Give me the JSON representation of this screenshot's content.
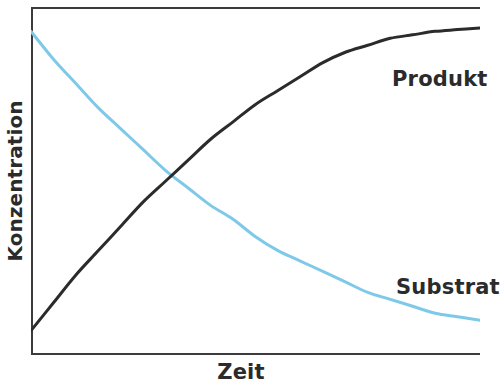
{
  "figure": {
    "background_color": "#ffffff",
    "frame_color": "#3b3b3b"
  },
  "axes": {
    "x_label": "Zeit",
    "y_label": "Konzentration"
  },
  "annotations": {
    "produkt_label": "Produkt",
    "substrat_label": "Substrat"
  },
  "chart_data": {
    "type": "line",
    "title": "",
    "subtitle": "",
    "xlabel": "Zeit",
    "ylabel": "Konzentration",
    "xlim": [
      0,
      1
    ],
    "ylim": [
      0,
      1
    ],
    "grid": false,
    "legend": "inline annotations at curve ends",
    "axis_ticks": {
      "x": [],
      "y": []
    },
    "series": [
      {
        "name": "Produkt",
        "color": "#2b2b2b",
        "line_width": 3,
        "annotation": "Produkt",
        "description": "Sigmoidal rise, saturating plateau",
        "x": [
          0.0,
          0.05,
          0.1,
          0.15,
          0.2,
          0.25,
          0.3,
          0.35,
          0.4,
          0.45,
          0.5,
          0.55,
          0.6,
          0.65,
          0.7,
          0.75,
          0.8,
          0.85,
          0.9,
          0.95,
          1.0
        ],
        "y": [
          0.07,
          0.15,
          0.23,
          0.3,
          0.37,
          0.44,
          0.5,
          0.56,
          0.62,
          0.67,
          0.72,
          0.76,
          0.8,
          0.84,
          0.87,
          0.89,
          0.91,
          0.92,
          0.93,
          0.935,
          0.94
        ]
      },
      {
        "name": "Substrat",
        "color": "#7fc9e8",
        "line_width": 3,
        "annotation": "Substrat",
        "description": "Exponential decay toward baseline",
        "x": [
          0.0,
          0.05,
          0.1,
          0.15,
          0.2,
          0.25,
          0.3,
          0.35,
          0.4,
          0.45,
          0.5,
          0.55,
          0.6,
          0.65,
          0.7,
          0.75,
          0.8,
          0.85,
          0.9,
          0.95,
          1.0
        ],
        "y": [
          0.93,
          0.85,
          0.78,
          0.71,
          0.65,
          0.59,
          0.53,
          0.48,
          0.43,
          0.39,
          0.34,
          0.3,
          0.27,
          0.24,
          0.21,
          0.18,
          0.16,
          0.14,
          0.12,
          0.11,
          0.1
        ]
      }
    ],
    "intersection": {
      "x": 0.238,
      "y": 0.5,
      "note": "Produkt and Substrat curves cross near mid-plot"
    }
  }
}
